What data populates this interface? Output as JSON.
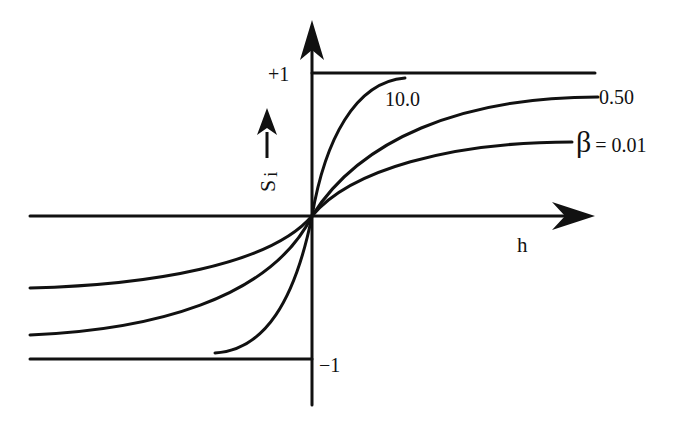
{
  "diagram": {
    "type": "sigmoid-response-curves",
    "axes": {
      "x_label": "h",
      "y_label": "S",
      "y_label_subscript": "i",
      "y_max_label": "+1",
      "y_min_label": "−1"
    },
    "curves": [
      {
        "name": "beta-10",
        "label": "10.0"
      },
      {
        "name": "beta-0.50",
        "label": "0.50"
      },
      {
        "name": "beta-0.01",
        "label_symbol": "β",
        "label_rest": "= 0.01"
      }
    ],
    "colors": {
      "ink": "#111111",
      "background": "#ffffff"
    }
  }
}
